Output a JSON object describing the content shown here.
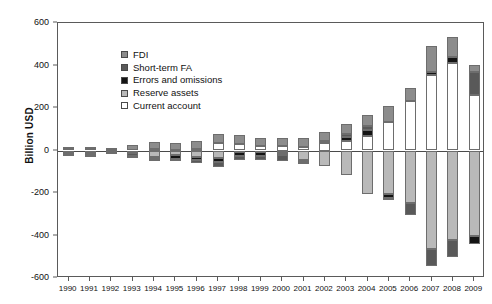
{
  "chart_data": {
    "type": "bar",
    "subtype": "stacked-diverging",
    "title": "",
    "xlabel": "",
    "ylabel": "Billion USD",
    "ylim": [
      -600,
      600
    ],
    "yticks": [
      600,
      400,
      200,
      0,
      -200,
      -400,
      -600
    ],
    "grid": false,
    "legend_position": "top-left",
    "categories": [
      "1990",
      "1991",
      "1992",
      "1993",
      "1994",
      "1995",
      "1996",
      "1997",
      "1998",
      "1999",
      "2000",
      "2001",
      "2002",
      "2003",
      "2004",
      "2005",
      "2006",
      "2007",
      "2008",
      "2009"
    ],
    "series": [
      {
        "name": "FDI",
        "color": "#8c8c8c",
        "values": [
          3,
          5,
          8,
          24,
          32,
          34,
          38,
          42,
          41,
          37,
          37,
          42,
          46,
          48,
          55,
          79,
          63,
          122,
          94,
          34
        ]
      },
      {
        "name": "Short-term FA",
        "color": "#595959",
        "values": [
          -2,
          -4,
          -9,
          -12,
          -2,
          -1,
          -10,
          -25,
          -22,
          -19,
          -26,
          -13,
          0,
          12,
          18,
          -6,
          -55,
          -80,
          -82,
          109
        ]
      },
      {
        "name": "Errors and omissions",
        "color": "#141414",
        "values": [
          -3,
          -7,
          -8,
          -10,
          -10,
          -18,
          -16,
          -17,
          -19,
          -18,
          -12,
          -5,
          8,
          18,
          27,
          -17,
          0,
          16,
          27,
          -42
        ]
      },
      {
        "name": "Reserve assets",
        "color": "#b9b9b9",
        "values": [
          -12,
          -14,
          2,
          -2,
          -30,
          -22,
          -31,
          -35,
          -6,
          -9,
          -11,
          -47,
          -75,
          -117,
          -206,
          -207,
          -247,
          -462,
          -419,
          -400
        ]
      },
      {
        "name": "Current account",
        "color": "#ffffff",
        "values": [
          12,
          13,
          6,
          -12,
          7,
          2,
          7,
          37,
          31,
          21,
          20,
          17,
          35,
          46,
          69,
          132,
          232,
          354,
          412,
          261
        ]
      }
    ],
    "legend_entries": [
      "FDI",
      "Short-term FA",
      "Errors and omissions",
      "Reserve assets",
      "Current account"
    ]
  },
  "axis": {
    "y_title": "Billion USD",
    "y_tick_labels": [
      "600",
      "400",
      "200",
      "0",
      "-200",
      "-400",
      "-600"
    ],
    "x_tick_labels": [
      "1990",
      "1991",
      "1992",
      "1993",
      "1994",
      "1995",
      "1996",
      "1997",
      "1998",
      "1999",
      "2000",
      "2001",
      "2002",
      "2003",
      "2004",
      "2005",
      "2006",
      "2007",
      "2008",
      "2009"
    ]
  },
  "colors": {
    "fdi": "#8c8c8c",
    "short_term_fa": "#595959",
    "errors_and_omissions": "#141414",
    "reserve_assets": "#b9b9b9",
    "current_account": "#ffffff",
    "axis": "#5a5a5a",
    "background": "#ffffff"
  }
}
